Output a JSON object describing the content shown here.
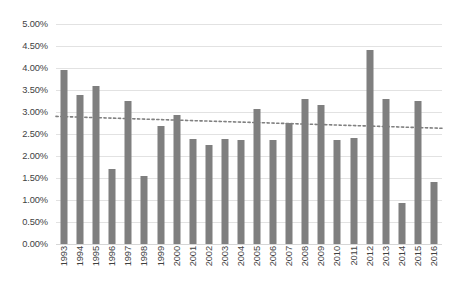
{
  "chart_data": {
    "type": "bar",
    "title": "",
    "xlabel": "",
    "ylabel": "",
    "ylim": [
      0,
      0.05
    ],
    "ytick_labels": [
      "5.00%",
      "4.50%",
      "4.00%",
      "3.50%",
      "3.00%",
      "2.50%",
      "2.00%",
      "1.50%",
      "1.00%",
      "0.50%",
      "0.00%"
    ],
    "ytick_values": [
      5.0,
      4.5,
      4.0,
      3.5,
      3.0,
      2.5,
      2.0,
      1.5,
      1.0,
      0.5,
      0.0
    ],
    "grid": true,
    "legend": "none",
    "categories": [
      "1993",
      "1994",
      "1995",
      "1996",
      "1997",
      "1998",
      "1999",
      "2000",
      "2001",
      "2002",
      "2003",
      "2004",
      "2005",
      "2006",
      "2007",
      "2008",
      "2009",
      "2010",
      "2011",
      "2012",
      "2013",
      "2014",
      "2015",
      "2016"
    ],
    "values": [
      3.95,
      3.38,
      3.58,
      1.7,
      3.25,
      1.55,
      2.68,
      2.93,
      2.38,
      2.25,
      2.38,
      2.36,
      3.07,
      2.36,
      2.75,
      3.3,
      3.16,
      2.36,
      2.4,
      4.4,
      3.3,
      0.93,
      3.25,
      1.42
    ],
    "units": "percent",
    "bar_color": "#7f7f7f",
    "gridline_color": "#e2e2e2",
    "annotations": [
      {
        "name": "linear-trendline",
        "style": "dotted",
        "color": "#808080",
        "start_value": 2.9,
        "end_value": 2.63
      }
    ]
  }
}
